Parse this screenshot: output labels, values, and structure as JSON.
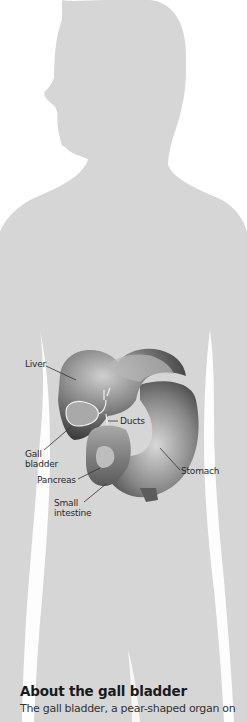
{
  "illustration": {
    "silhouette_color": "#d6d6d6",
    "background_color": "#ffffff",
    "labels": {
      "liver": "Liver",
      "ducts": "Ducts",
      "gall_bladder_line1": "Gall",
      "gall_bladder_line2": "bladder",
      "stomach": "Stomach",
      "pancreas": "Pancreas",
      "small_intestine_line1": "Small",
      "small_intestine_line2": "intestine"
    }
  },
  "article": {
    "heading": "About the gall bladder",
    "body_start": "The gall bladder, a pear-shaped organ on"
  }
}
